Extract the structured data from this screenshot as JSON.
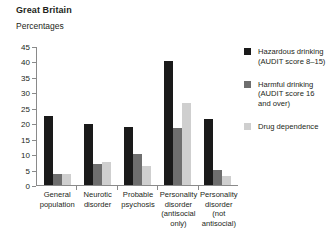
{
  "header": {
    "title": "Great Britain",
    "subtitle": "Percentages"
  },
  "chart_data": {
    "type": "bar",
    "title": "Great Britain",
    "subtitle": "Percentages",
    "xlabel": "",
    "ylabel": "Percentages",
    "ylim": [
      0,
      45
    ],
    "yticks": [
      0,
      5,
      10,
      15,
      20,
      25,
      30,
      35,
      40,
      45
    ],
    "grid": false,
    "legend_position": "right",
    "categories": [
      "General population",
      "Neurotic disorder",
      "Probable psychosis",
      "Personality disorder (antisocial only)",
      "Personality disorder (not antisocial)"
    ],
    "category_lines": [
      [
        "General",
        "population"
      ],
      [
        "Neurotic",
        "disorder"
      ],
      [
        "Probable",
        "psychosis"
      ],
      [
        "Personality",
        "disorder",
        "(antisocial",
        "only)"
      ],
      [
        "Personality",
        "disorder",
        "(not",
        "antisocial)"
      ]
    ],
    "series": [
      {
        "name": "Hazardous drinking (AUDIT score 8–15)",
        "name_lines": [
          "Hazardous drinking",
          "(AUDIT score 8–15)"
        ],
        "color": "#1a1a1a",
        "values": [
          22.5,
          19.7,
          18.8,
          40.0,
          21.5
        ]
      },
      {
        "name": "Harmful drinking (AUDIT score 16 and over)",
        "name_lines": [
          "Harmful drinking",
          "(AUDIT score 16",
          "and over)"
        ],
        "color": "#6e6e6e",
        "values": [
          3.6,
          6.8,
          10.0,
          18.5,
          5.0
        ]
      },
      {
        "name": "Drug dependence",
        "name_lines": [
          "Drug dependence"
        ],
        "color": "#cfcfcf",
        "values": [
          3.7,
          7.6,
          6.0,
          26.5,
          3.0
        ]
      }
    ]
  }
}
